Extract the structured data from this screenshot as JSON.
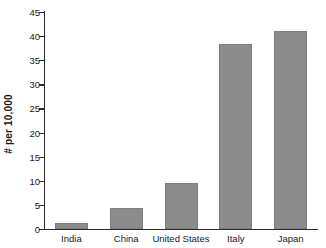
{
  "chart_data": {
    "type": "bar",
    "title": "",
    "xlabel": "",
    "ylabel": "# per 10,000",
    "categories": [
      "India",
      "China",
      "United States",
      "Italy",
      "Japan"
    ],
    "values": [
      1.2,
      4.4,
      9.5,
      38.3,
      41
    ],
    "ylim": [
      0,
      45
    ],
    "yticks": [
      0,
      5,
      10,
      15,
      20,
      25,
      30,
      35,
      40,
      45
    ],
    "ytick_labels": [
      "0",
      "5",
      "10",
      "15",
      "20",
      "25",
      "30",
      "35",
      "40",
      "45"
    ],
    "grid": false,
    "legend": null,
    "series": [
      {
        "name": "# per 10,000",
        "values": [
          1.2,
          4.4,
          9.5,
          38.3,
          41
        ],
        "color": "#8c8c8c"
      }
    ]
  },
  "colors": {
    "bar": "#8c8c8c",
    "bar_edge": "#7f7f7f",
    "axis": "#2b2b2b",
    "text": "#1a1a1a",
    "background": "#ffffff"
  }
}
